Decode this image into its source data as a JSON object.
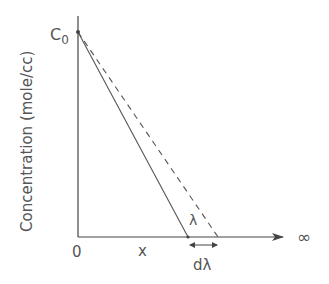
{
  "diagram": {
    "y_axis_label": "Concentration (mole/cc)",
    "y_tick_c0": "C",
    "y_tick_c0_sub": "0",
    "origin_label": "0",
    "x_label": "x",
    "lambda_label": "λ",
    "dlambda_label": "dλ",
    "infinity_label": "∞"
  },
  "colors": {
    "axis": "#444444",
    "line": "#555555",
    "text": "#555555"
  }
}
